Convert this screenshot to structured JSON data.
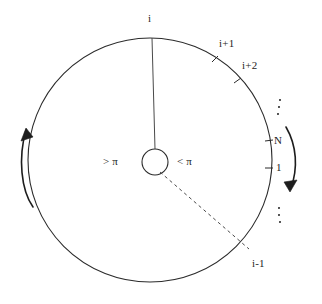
{
  "figure": {
    "type": "diagram",
    "title": "",
    "background_color": "#ffffff",
    "stroke_color": "#2b2b2b",
    "text_color": "#1d1d1d"
  },
  "geometry": {
    "outer_circle": {
      "cx": 150,
      "cy": 160,
      "r": 122
    },
    "inner_circle": {
      "cx": 155,
      "cy": 162,
      "r": 13
    },
    "reference_radius_angle_deg": 90,
    "dashed_radius_angle_deg": -52
  },
  "labels": {
    "node_i": "i",
    "node_i_plus_1": "i+1",
    "node_i_plus_2": "i+2",
    "node_N": "N",
    "node_1": "1",
    "node_i_minus_1": "i-1",
    "angle_greater": "> π",
    "angle_less": "< π",
    "ellipsis_upper": "⋮",
    "ellipsis_lower": "⋮"
  },
  "arrows": {
    "left": {
      "name": "counterclockwise-arrow",
      "direction": "up"
    },
    "right": {
      "name": "clockwise-arrow",
      "direction": "down"
    }
  },
  "tick_marks": [
    {
      "label": "i+1",
      "angle_deg": 58
    },
    {
      "label": "i+2",
      "angle_deg": 42
    },
    {
      "label": "N",
      "angle_deg": 9
    },
    {
      "label": "1",
      "angle_deg": -4
    }
  ]
}
